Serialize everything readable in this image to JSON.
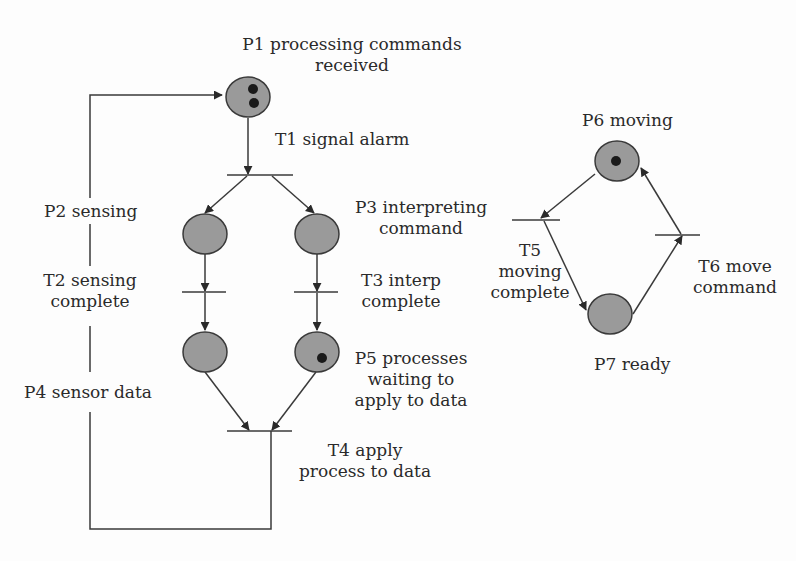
{
  "diagram": {
    "type": "petri-net",
    "colors": {
      "place_fill": "#9a9a9a",
      "stroke": "#3a3a3a",
      "token": "#1a1a1a",
      "background": "#fdfdfd"
    },
    "places": [
      {
        "id": "P1",
        "label": "P1 processing commands",
        "label2": "received",
        "tokens": 2
      },
      {
        "id": "P2",
        "label": "P2 sensing",
        "tokens": 0
      },
      {
        "id": "P3",
        "label": "P3 interpreting",
        "label2": "command",
        "tokens": 0
      },
      {
        "id": "P4",
        "label": "P4 sensor data",
        "tokens": 0
      },
      {
        "id": "P5",
        "label": "P5 processes",
        "label2": "waiting to",
        "label3": "apply to data",
        "tokens": 1
      },
      {
        "id": "P6",
        "label": "P6 moving",
        "tokens": 1
      },
      {
        "id": "P7",
        "label": "P7 ready",
        "tokens": 0
      }
    ],
    "transitions": [
      {
        "id": "T1",
        "label": "T1 signal alarm"
      },
      {
        "id": "T2",
        "label": "T2 sensing",
        "label2": "complete"
      },
      {
        "id": "T3",
        "label": "T3 interp",
        "label2": "complete"
      },
      {
        "id": "T4",
        "label": "T4 apply",
        "label2": "process to data"
      },
      {
        "id": "T5",
        "label": "T5",
        "label2": "moving",
        "label3": "complete"
      },
      {
        "id": "T6",
        "label": "T6 move",
        "label2": "command"
      }
    ]
  }
}
